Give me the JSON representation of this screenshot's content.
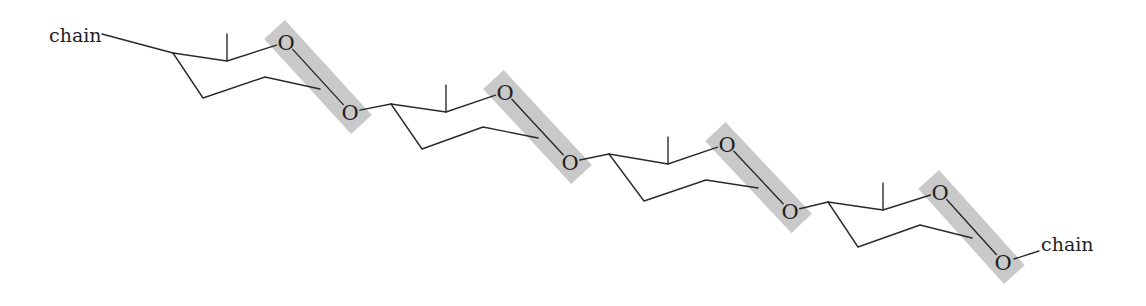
{
  "diagram": {
    "canvas": {
      "width": 1146,
      "height": 306
    },
    "colors": {
      "bond": "#2a2a2a",
      "highlight": "#c9c9c9",
      "text": "#1e1e1e",
      "background": "#ffffff"
    },
    "chain_left": {
      "label": "chain",
      "text_x": 49,
      "text_y": 42,
      "bond": [
        102,
        34,
        173,
        53
      ]
    },
    "chain_right": {
      "label": "chain",
      "text_x": 1041,
      "text_y": 251,
      "bond": [
        1014,
        259,
        1039,
        251
      ]
    },
    "oxygen_label": "O",
    "units": [
      {
        "c4": [
          173,
          53
        ],
        "c3": [
          227,
          61
        ],
        "methyl": [
          227,
          34
        ],
        "o_top": [
          286,
          42
        ],
        "c5": [
          203,
          98
        ],
        "c2": [
          265,
          77
        ],
        "c1": [
          320,
          89
        ],
        "o_bottom": [
          350,
          112
        ]
      },
      {
        "c4": [
          391,
          104
        ],
        "c3": [
          446,
          112
        ],
        "methyl": [
          446,
          85
        ],
        "o_top": [
          505,
          92
        ],
        "c5": [
          422,
          149
        ],
        "c2": [
          483,
          127
        ],
        "c1": [
          538,
          138
        ],
        "o_bottom": [
          570,
          162
        ]
      },
      {
        "c4": [
          609,
          154
        ],
        "c3": [
          668,
          164
        ],
        "methyl": [
          668,
          137
        ],
        "o_top": [
          727,
          144
        ],
        "c5": [
          644,
          201
        ],
        "c2": [
          706,
          180
        ],
        "c1": [
          758,
          188
        ],
        "o_bottom": [
          790,
          211
        ]
      },
      {
        "c4": [
          828,
          202
        ],
        "c3": [
          883,
          210
        ],
        "methyl": [
          883,
          183
        ],
        "o_top": [
          940,
          192
        ],
        "c5": [
          858,
          247
        ],
        "c2": [
          920,
          225
        ],
        "c1": [
          972,
          238
        ],
        "o_bottom": [
          1003,
          262
        ]
      }
    ],
    "highlight_box": {
      "half_width": 14,
      "extend": 17
    },
    "atom_radius": 10
  }
}
